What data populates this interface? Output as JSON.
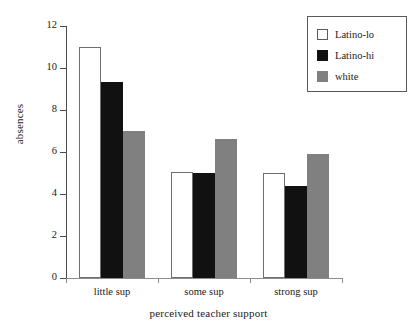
{
  "chart_data": {
    "type": "bar",
    "title": "",
    "xlabel": "perceived teacher support",
    "ylabel": "absences",
    "categories": [
      "little sup",
      "some sup",
      "strong sup"
    ],
    "series": [
      {
        "name": "Latino-lo",
        "color": "#ffffff",
        "values": [
          11.0,
          5.05,
          5.0
        ]
      },
      {
        "name": "Latino-hi",
        "color": "#111111",
        "values": [
          9.35,
          5.0,
          4.4
        ]
      },
      {
        "name": "white",
        "color": "#808080",
        "values": [
          7.0,
          6.6,
          5.9
        ]
      }
    ],
    "ylim": [
      0,
      12
    ],
    "yticks": [
      0,
      2,
      4,
      6,
      8,
      10,
      12
    ],
    "ytick_labels": [
      "0",
      "2",
      "4",
      "6",
      "8",
      "10",
      "12"
    ],
    "grid": false,
    "legend_position": "top-right"
  },
  "legend": {
    "items": [
      {
        "label": "Latino-lo",
        "swatch": "white-square-swatch"
      },
      {
        "label": "Latino-hi",
        "swatch": "black-square-swatch"
      },
      {
        "label": "white",
        "swatch": "gray-square-swatch"
      }
    ]
  },
  "axes": {
    "y_title": "absences",
    "x_title": "perceived teacher support"
  }
}
